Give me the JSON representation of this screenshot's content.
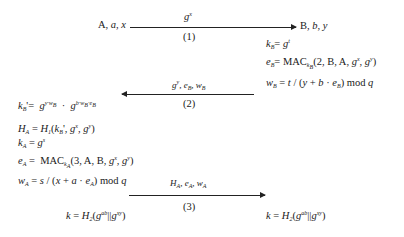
{
  "parties": {
    "alice": {
      "label": "A, a, x"
    },
    "bob": {
      "label": "B, b, y"
    }
  },
  "messages": [
    {
      "num": "(1)",
      "content": "g^x",
      "direction": "A→B"
    },
    {
      "num": "(2)",
      "content": "g^y, e_B, w_B",
      "direction": "B→A"
    },
    {
      "num": "(3)",
      "content": "H_A, e_A, w_A",
      "direction": "A→B"
    }
  ],
  "bob_steps": [
    "k_B = g^t",
    "e_B = MAC_{k_B}(2, B, A, g^x, g^y)",
    "w_B = t/(y + b · e_B) mod q"
  ],
  "alice_steps": [
    "k_B' = g^{y·w_B} · g^{b·w_B·e_B}",
    "H_A = H_1(k_B', g^x, g^y)",
    "k_A = g^s",
    "e_A = MAC_{k_A}(3, A, B, g^x, g^y)",
    "w_A = s/(x + a · e_A) mod q"
  ],
  "session_key": {
    "alice": "k = H_2(g^{ab} || g^{xy})",
    "bob": "k = H_2(g^{ab} || g^{xy})"
  }
}
